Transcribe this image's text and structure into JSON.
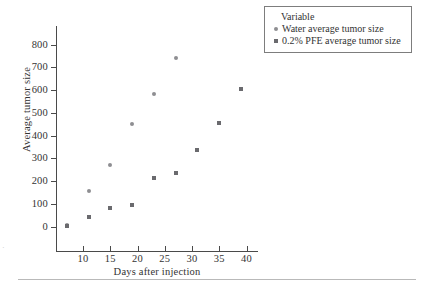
{
  "chart_data": {
    "type": "scatter",
    "title": "",
    "xlabel": "Days after injection",
    "ylabel": "Average tumor size",
    "xlim": [
      5,
      42
    ],
    "ylim": [
      -40,
      860
    ],
    "xticks": [
      10,
      15,
      20,
      25,
      30,
      35,
      40
    ],
    "yticks": [
      0,
      100,
      200,
      300,
      400,
      500,
      600,
      700,
      800
    ],
    "grid": false,
    "legend_position": "top-right",
    "legend_title": "Variable",
    "series": [
      {
        "name": "Water average tumor size",
        "marker": "circle",
        "color": "#8e8e92",
        "points": [
          {
            "x": 7,
            "y": 5
          },
          {
            "x": 11,
            "y": 155
          },
          {
            "x": 15,
            "y": 272
          },
          {
            "x": 19,
            "y": 452
          },
          {
            "x": 23,
            "y": 583
          },
          {
            "x": 27,
            "y": 740
          }
        ]
      },
      {
        "name": "0.2% PFE average tumor size",
        "marker": "square",
        "color": "#6a6a6e",
        "points": [
          {
            "x": 7,
            "y": 3
          },
          {
            "x": 11,
            "y": 42
          },
          {
            "x": 15,
            "y": 80
          },
          {
            "x": 19,
            "y": 93
          },
          {
            "x": 23,
            "y": 213
          },
          {
            "x": 27,
            "y": 235
          },
          {
            "x": 31,
            "y": 335
          },
          {
            "x": 35,
            "y": 453
          },
          {
            "x": 39,
            "y": 603
          }
        ]
      }
    ]
  },
  "legend": {
    "title": "Variable",
    "entries": [
      {
        "label": "Water average tumor size",
        "marker": "circle"
      },
      {
        "label": "0.2% PFE average tumor size",
        "marker": "square"
      }
    ]
  },
  "axes": {
    "x_title": "Days after injection",
    "y_title": "Average tumor size"
  }
}
